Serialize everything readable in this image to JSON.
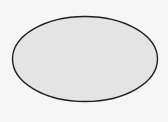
{
  "diagram": {
    "shapes": [
      {
        "type": "ellipse",
        "cx": 85,
        "cy": 59,
        "rx": 72.5,
        "ry": 42.5,
        "fill": "#e4e4e4",
        "stroke": "#1e1e1e",
        "stroke_width": 1.4,
        "label": ""
      }
    ],
    "background": "#f6f6f6"
  }
}
